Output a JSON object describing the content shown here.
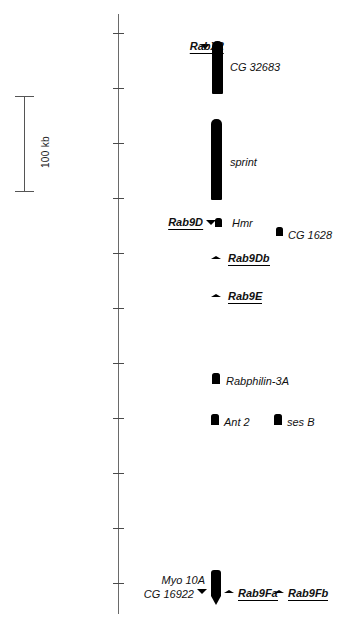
{
  "figure": {
    "background_color": "#ffffff",
    "glyph_color": "#000000",
    "axis_color": "#6a6a6a"
  },
  "scale_bar": {
    "label": "100 kb",
    "length_px": 96,
    "unit": "kb",
    "value": 100
  },
  "axis": {
    "name": "chromosome-axis",
    "x_px": 118,
    "top_px": 14,
    "bottom_px": 614,
    "tick_count": 11,
    "tick_spacing_px": 55,
    "first_tick_px": 33
  },
  "features": [
    {
      "id": "rabx2",
      "label": "RabX2",
      "style": "bold-underline",
      "align": "right",
      "glyph": "triangle-down",
      "label_x": 224,
      "label_y": 40,
      "glyph_x": 200,
      "glyph_y": 44
    },
    {
      "id": "cg32683",
      "label": "CG 32683",
      "style": "plain",
      "align": "left",
      "glyph": "bar-round-top",
      "label_x": 230,
      "label_y": 61,
      "glyph_x": 212,
      "glyph_y": 41,
      "glyph_w": 11,
      "glyph_h": 53
    },
    {
      "id": "sprint",
      "label": "sprint",
      "style": "plain",
      "align": "left",
      "glyph": "bar-round-top",
      "label_x": 230,
      "label_y": 156,
      "glyph_x": 211,
      "glyph_y": 119,
      "glyph_w": 11,
      "glyph_h": 81
    },
    {
      "id": "rab9d",
      "label": "Rab9D",
      "style": "bold-underline",
      "align": "right",
      "glyph": "triangle-down",
      "label_x": 203,
      "label_y": 216,
      "glyph_x": 206,
      "glyph_y": 220
    },
    {
      "id": "hmr",
      "label": "Hmr",
      "style": "plain",
      "align": "left",
      "glyph": "box",
      "label_x": 232,
      "label_y": 217,
      "glyph_x": 215,
      "glyph_y": 218,
      "glyph_w": 7,
      "glyph_h": 9
    },
    {
      "id": "cg1628",
      "label": "CG 1628",
      "style": "plain",
      "align": "left",
      "glyph": "box",
      "label_x": 288,
      "label_y": 229,
      "glyph_x": 276,
      "glyph_y": 227,
      "glyph_w": 7,
      "glyph_h": 9
    },
    {
      "id": "rab9db",
      "label": "Rab9Db",
      "style": "bold-underline",
      "align": "left",
      "glyph": "triangle-up-flat",
      "label_x": 228,
      "label_y": 252,
      "glyph_x": 211,
      "glyph_y": 256
    },
    {
      "id": "rab9e",
      "label": "Rab9E",
      "style": "bold-underline",
      "align": "left",
      "glyph": "triangle-up-flat",
      "label_x": 228,
      "label_y": 290,
      "glyph_x": 211,
      "glyph_y": 294
    },
    {
      "id": "rabphilin3a",
      "label": "Rabphilin-3A",
      "style": "plain",
      "align": "left",
      "glyph": "box",
      "label_x": 226,
      "label_y": 375,
      "glyph_x": 212,
      "glyph_y": 373,
      "glyph_w": 8,
      "glyph_h": 11
    },
    {
      "id": "ant2",
      "label": "Ant 2",
      "style": "plain",
      "align": "left",
      "glyph": "box",
      "label_x": 224,
      "label_y": 416,
      "glyph_x": 211,
      "glyph_y": 414,
      "glyph_w": 8,
      "glyph_h": 11
    },
    {
      "id": "sesb",
      "label": "ses B",
      "style": "plain",
      "align": "left",
      "glyph": "box",
      "label_x": 287,
      "label_y": 416,
      "glyph_x": 274,
      "glyph_y": 414,
      "glyph_w": 8,
      "glyph_h": 11
    },
    {
      "id": "myo10a",
      "label": "Myo 10A",
      "style": "plain",
      "align": "right",
      "glyph": "none",
      "label_x": 205,
      "label_y": 574
    },
    {
      "id": "cg16922",
      "label": "CG 16922",
      "style": "plain",
      "align": "right",
      "glyph": "triangle-down",
      "label_x": 194,
      "label_y": 588,
      "glyph_x": 197,
      "glyph_y": 589
    },
    {
      "id": "myo10a-bar",
      "label": "",
      "style": "plain",
      "align": "left",
      "glyph": "bar-point-bottom",
      "glyph_x": 211,
      "glyph_y": 570,
      "glyph_w": 10,
      "glyph_h": 26
    },
    {
      "id": "rab9fa",
      "label": "Rab9Fa",
      "style": "bold-underline",
      "align": "left",
      "glyph": "triangle-up-flat",
      "label_x": 238,
      "label_y": 587,
      "glyph_x": 224,
      "glyph_y": 590
    },
    {
      "id": "rab9fb",
      "label": "Rab9Fb",
      "style": "bold-underline",
      "align": "left",
      "glyph": "triangle-up-flat",
      "label_x": 288,
      "label_y": 587,
      "glyph_x": 274,
      "glyph_y": 590
    }
  ]
}
